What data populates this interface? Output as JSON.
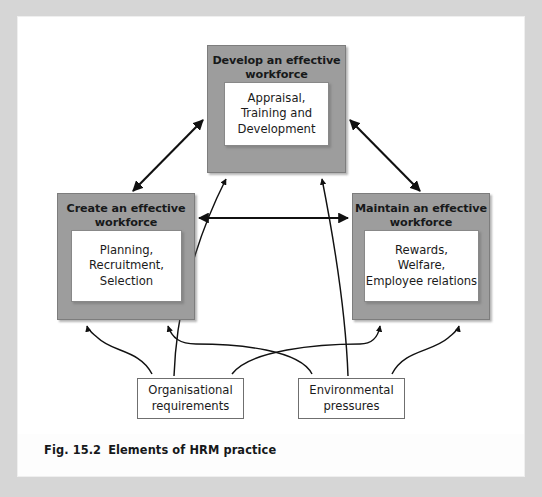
{
  "figure": {
    "caption_number": "Fig. 15.2",
    "caption_title": "Elements of HRM practice",
    "colors": {
      "box_fill": "#9d9d9d",
      "box_border": "#7d7d7d",
      "inner_fill": "#ffffff",
      "inner_border": "#888888",
      "arrow": "#111111",
      "page_background": "#d6d6d6",
      "sheet_background": "#fdfdfd"
    }
  },
  "nodes": {
    "develop": {
      "title": "Develop an effective\nworkforce",
      "detail": "Appraisal,\nTraining and\nDevelopment"
    },
    "create": {
      "title": "Create an effective\nworkforce",
      "detail": "Planning,\nRecruitment,\nSelection"
    },
    "maintain": {
      "title": "Maintain an effective\nworkforce",
      "detail": "Rewards,\nWelfare,\nEmployee relations"
    },
    "organisational": {
      "label": "Organisational\nrequirements"
    },
    "environmental": {
      "label": "Environmental\npressures"
    }
  },
  "edges": [
    {
      "id": "create-develop",
      "from": "create",
      "to": "develop",
      "style": "double-headed-straight"
    },
    {
      "id": "develop-maintain",
      "from": "develop",
      "to": "maintain",
      "style": "double-headed-straight"
    },
    {
      "id": "create-maintain",
      "from": "create",
      "to": "maintain",
      "style": "double-headed-straight"
    },
    {
      "id": "org-develop",
      "from": "organisational",
      "to": "develop",
      "style": "curved-single"
    },
    {
      "id": "org-create",
      "from": "organisational",
      "to": "create",
      "style": "curved-single"
    },
    {
      "id": "org-maintain",
      "from": "organisational",
      "to": "maintain",
      "style": "curved-single"
    },
    {
      "id": "env-develop",
      "from": "environmental",
      "to": "develop",
      "style": "curved-single"
    },
    {
      "id": "env-create",
      "from": "environmental",
      "to": "create",
      "style": "curved-single"
    },
    {
      "id": "env-maintain",
      "from": "environmental",
      "to": "maintain",
      "style": "curved-single"
    }
  ]
}
